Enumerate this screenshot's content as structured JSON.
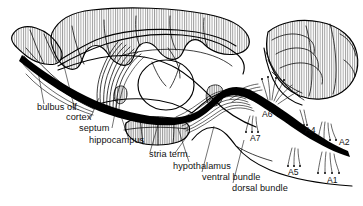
{
  "figure": {
    "background_color": "#ffffff",
    "ink_color": "#000000"
  },
  "labels": {
    "bulbus_olf": "bulbus olf.",
    "cortex": "cortex",
    "septum": "septum",
    "hippocampus": "hippocampus",
    "stria_term": "stria term.",
    "hypothalamus": "hypothalamus",
    "ventral_bundle": "ventral bundle",
    "dorsal_bundle": "dorsal bundle",
    "a1": "A1",
    "a2": "A2",
    "a4": "A4",
    "a5": "A5",
    "a6": "A6",
    "a7": "A7"
  },
  "structures": [
    {
      "name": "olfactory-bulb",
      "label": "bulbus olf.",
      "hatched": true
    },
    {
      "name": "cerebral-cortex",
      "label": "cortex",
      "hatched": true
    },
    {
      "name": "septum",
      "label": "septum",
      "hatched": false
    },
    {
      "name": "hippocampus",
      "label": "hippocampus",
      "hatched": false
    },
    {
      "name": "stria-terminalis",
      "label": "stria term.",
      "hatched": true
    },
    {
      "name": "hypothalamus",
      "label": "hypothalamus",
      "hatched": true
    },
    {
      "name": "thalamus",
      "label": "",
      "hatched": false
    },
    {
      "name": "cerebellum",
      "label": "",
      "hatched": true
    },
    {
      "name": "brainstem",
      "label": "",
      "hatched": false
    }
  ],
  "pathways": [
    {
      "name": "dorsal-bundle",
      "label": "dorsal bundle"
    },
    {
      "name": "ventral-bundle",
      "label": "ventral bundle"
    }
  ],
  "cell_groups": [
    {
      "id": "A1",
      "label": "A1"
    },
    {
      "id": "A2",
      "label": "A2"
    },
    {
      "id": "A4",
      "label": "A4"
    },
    {
      "id": "A5",
      "label": "A5"
    },
    {
      "id": "A6",
      "label": "A6"
    },
    {
      "id": "A7",
      "label": "A7"
    }
  ]
}
